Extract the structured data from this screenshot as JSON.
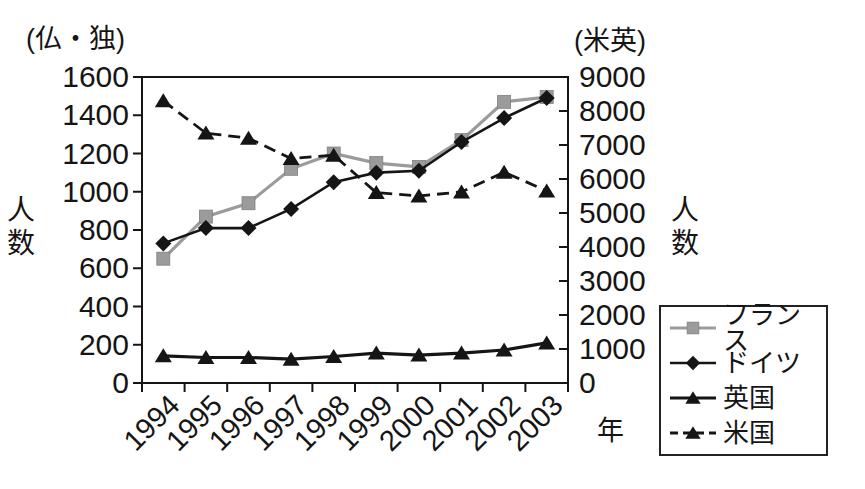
{
  "chart_data": {
    "type": "line",
    "title": "",
    "x_axis": {
      "title": "年",
      "labels": [
        "1994",
        "1995",
        "1996",
        "1997",
        "1998",
        "1999",
        "2000",
        "2001",
        "2002",
        "2003"
      ]
    },
    "left_axis": {
      "unit_label": "(仏・独)",
      "title": "人数",
      "min": 0,
      "max": 1600,
      "step": 200
    },
    "right_axis": {
      "unit_label": "(米英)",
      "title": "人数",
      "min": 0,
      "max": 9000,
      "step": 1000
    },
    "series": [
      {
        "name": "フランス",
        "axis": "left",
        "color": "#9b9b9b",
        "marker": "square",
        "dash": null,
        "line_width": 3.2,
        "values": [
          650,
          870,
          940,
          1120,
          1200,
          1150,
          1130,
          1270,
          1470,
          1495
        ]
      },
      {
        "name": "ドイツ",
        "axis": "left",
        "color": "#151515",
        "marker": "diamond",
        "dash": null,
        "line_width": 2.6,
        "values": [
          730,
          810,
          810,
          910,
          1050,
          1100,
          1110,
          1260,
          1385,
          1490
        ]
      },
      {
        "name": "英国",
        "axis": "right",
        "color": "#151515",
        "marker": "triangle",
        "dash": null,
        "line_width": 3.2,
        "values": [
          800,
          750,
          750,
          700,
          780,
          880,
          820,
          880,
          970,
          1180
        ]
      },
      {
        "name": "米国",
        "axis": "right",
        "color": "#151515",
        "marker": "triangle",
        "dash": "12,7",
        "line_width": 2.8,
        "values": [
          8300,
          7350,
          7200,
          6600,
          6700,
          5600,
          5500,
          5620,
          6200,
          5650
        ]
      }
    ],
    "legend": {
      "position": "bottom-right",
      "entries": [
        "フランス",
        "ドイツ",
        "英国",
        "米国"
      ]
    },
    "grid": "off",
    "colors": {
      "ink": "#151515",
      "gray_series": "#9b9b9b",
      "background": "#ffffff"
    }
  }
}
